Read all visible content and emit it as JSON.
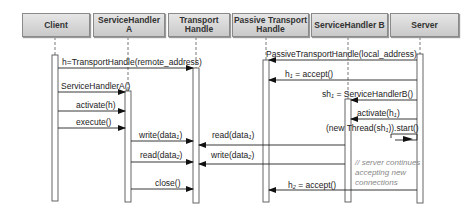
{
  "participants": [
    {
      "id": "client",
      "label": "Client"
    },
    {
      "id": "sha",
      "label": "ServiceHandler A"
    },
    {
      "id": "th",
      "label": "Transport Handle"
    },
    {
      "id": "pth",
      "label": "Passive Transport Handle"
    },
    {
      "id": "shb",
      "label": "ServiceHandler B"
    },
    {
      "id": "server",
      "label": "Server"
    }
  ],
  "messages": [
    {
      "label": "h=TransportHandle(remote_address)",
      "from": "Client",
      "to": "Transport Handle"
    },
    {
      "label": "PassiveTransportHandle(local_address)",
      "from": "Server",
      "to": "Passive Transport Handle"
    },
    {
      "label": "h1 = accept()",
      "from": "Server",
      "to": "Passive Transport Handle"
    },
    {
      "label": "ServiceHandlerA()",
      "from": "Client",
      "to": "ServiceHandler A"
    },
    {
      "label": "sh1 = ServiceHandlerB()",
      "from": "Server",
      "to": "ServiceHandler B"
    },
    {
      "label": "activate(h)",
      "from": "Client",
      "to": "ServiceHandler A"
    },
    {
      "label": "activate(h1)",
      "from": "Server",
      "to": "ServiceHandler B"
    },
    {
      "label": "execute()",
      "from": "Client",
      "to": "ServiceHandler A"
    },
    {
      "label": "(new Thread(sh1)).start()",
      "from": "Server",
      "to": "Server"
    },
    {
      "label": "write(data1)",
      "from": "ServiceHandler A",
      "to": "Transport Handle"
    },
    {
      "label": "read(data1)",
      "from": "ServiceHandler B",
      "to": "Transport Handle"
    },
    {
      "label": "read(data2)",
      "from": "ServiceHandler A",
      "to": "Transport Handle"
    },
    {
      "label": "write(data2)",
      "from": "ServiceHandler B",
      "to": "Transport Handle"
    },
    {
      "label": "close()",
      "from": "ServiceHandler A",
      "to": "Transport Handle"
    },
    {
      "label": "h2 = accept()",
      "from": "Server",
      "to": "Passive Transport Handle"
    }
  ],
  "labels": {
    "m1": {
      "main": "h=TransportHandle(remote_address)"
    },
    "m2": {
      "main": "PassiveTransportHandle(local_address)"
    },
    "m3": {
      "pre": "h",
      "sub": "1",
      "post": " = accept()"
    },
    "m4": {
      "main": "ServiceHandlerA()"
    },
    "m5": {
      "pre": "sh",
      "sub": "1",
      "post": " = ServiceHandlerB()"
    },
    "m6": {
      "main": "activate(h)"
    },
    "m7": {
      "pre": "activate(h",
      "sub": "1",
      "post": ")"
    },
    "m8": {
      "main": "execute()"
    },
    "m9": {
      "pre": "(new Thread(sh",
      "sub": "1",
      "post": ")).start()"
    },
    "m10": {
      "pre": "write(data",
      "sub": "1",
      "post": ")"
    },
    "m11": {
      "pre": "read(data",
      "sub": "1",
      "post": ")"
    },
    "m12": {
      "pre": "read(data",
      "sub": "2",
      "post": ")"
    },
    "m13": {
      "pre": "write(data",
      "sub": "2",
      "post": ")"
    },
    "m14": {
      "main": "close()"
    },
    "m15": {
      "pre": "h",
      "sub": "2",
      "post": " = accept()"
    }
  },
  "note": {
    "line1": "// server continues",
    "line2": "accepting new",
    "line3": "connections"
  }
}
